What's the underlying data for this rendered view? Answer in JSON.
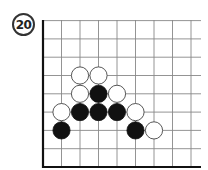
{
  "diagram": {
    "number": "20",
    "board": {
      "origin_x": 43,
      "origin_y": 167,
      "spacing_x": 18.5,
      "spacing_y": 18.3,
      "cols": 9,
      "rows": 8,
      "right_extent": 201,
      "top_extent": 20,
      "line_color": "#888888",
      "edge_color": "#111111"
    },
    "stones": [
      {
        "color": "white",
        "col": 2,
        "row": 5
      },
      {
        "color": "white",
        "col": 3,
        "row": 5
      },
      {
        "color": "white",
        "col": 2,
        "row": 4
      },
      {
        "color": "black",
        "col": 3,
        "row": 4
      },
      {
        "color": "white",
        "col": 4,
        "row": 4
      },
      {
        "color": "white",
        "col": 1,
        "row": 3
      },
      {
        "color": "black",
        "col": 2,
        "row": 3
      },
      {
        "color": "black",
        "col": 3,
        "row": 3
      },
      {
        "color": "black",
        "col": 4,
        "row": 3
      },
      {
        "color": "white",
        "col": 5,
        "row": 3
      },
      {
        "color": "black",
        "col": 1,
        "row": 2
      },
      {
        "color": "black",
        "col": 5,
        "row": 2
      },
      {
        "color": "white",
        "col": 6,
        "row": 2
      }
    ]
  }
}
